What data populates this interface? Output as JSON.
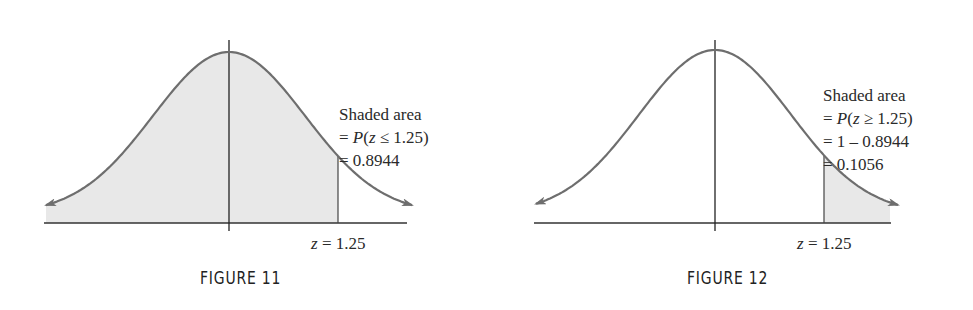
{
  "chart_data": [
    {
      "type": "area",
      "title": "FIGURE 11",
      "distribution": "standard normal",
      "shaded_region": "z <= 1.25",
      "z_marker": 1.25,
      "annotation": [
        "Shaded area",
        "= P(z ≤ 1.25)",
        "= 0.8944"
      ],
      "shaded_area": 0.8944,
      "x_label": "z = 1.25",
      "grid": false
    },
    {
      "type": "area",
      "title": "FIGURE 12",
      "distribution": "standard normal",
      "shaded_region": "z >= 1.25",
      "z_marker": 1.25,
      "annotation": [
        "Shaded area",
        "= P(z ≥ 1.25)",
        "= 1 – 0.8944",
        "= 0.1056"
      ],
      "shaded_area": 0.1056,
      "x_label": "z = 1.25",
      "grid": false
    }
  ],
  "figures": {
    "fig11": {
      "caption": "FIGURE 11",
      "z_label": "z = 1.25",
      "note": {
        "line1": "Shaded area",
        "line2_prefix": "= ",
        "line2_p": "P",
        "line2_open": "(",
        "line2_var": "z",
        "line2_rest": " ≤ 1.25)",
        "line3": "= 0.8944"
      }
    },
    "fig12": {
      "caption": "FIGURE 12",
      "z_label": "z = 1.25",
      "note": {
        "line1": "Shaded area",
        "line2_prefix": "= ",
        "line2_p": "P",
        "line2_open": "(",
        "line2_var": "z",
        "line2_rest": " ≥ 1.25)",
        "line3": "= 1 – 0.8944",
        "line4": "= 0.1056"
      }
    },
    "colors": {
      "curve": "#6e6e6e",
      "shade": "#e6e6e6",
      "axis": "#333333"
    }
  }
}
